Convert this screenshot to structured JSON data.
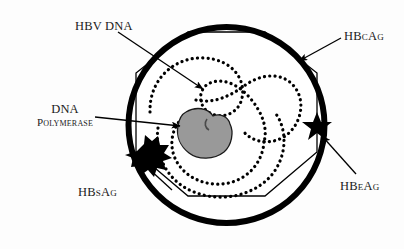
{
  "figure": {
    "background_color": "#fdfdfd",
    "ink_color": "#000000",
    "polymerase_fill": "#999999",
    "polymerase_stroke": "#1a1a1a"
  },
  "labels": {
    "hbv_dna": "HBV DNA",
    "hbcag": "HBcAg",
    "dna_polymerase_line1": "DNA",
    "dna_polymerase_line2": "Polymerase",
    "hbsag": "HBsAg",
    "hbeag": "HBeAg"
  },
  "parts": {
    "envelope": "outer-envelope-circle",
    "nucleocapsid": "inner-capsid-octagon",
    "dna_strand": "dotted-circular-dna-strand",
    "polymerase_blob": "dna-polymerase-blob",
    "hbsag_burst": "hbsag-starburst",
    "hbeag_star": "hbeag-five-point-star"
  },
  "leaders": {
    "hbv_dna": "arrow-pointing-down-right-to-dna",
    "hbcag": "arrow-pointing-down-left-to-capsid",
    "dna_polymerase": "arrow-pointing-right-to-polymerase",
    "hbsag": "line-to-starburst",
    "hbeag": "arrow-pointing-up-left-to-star"
  }
}
